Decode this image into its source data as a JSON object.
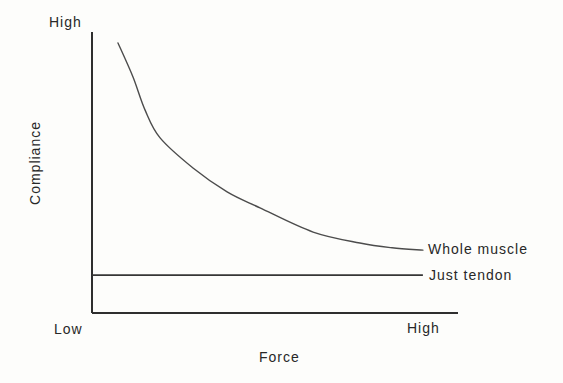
{
  "figure": {
    "background_color": "#fdfdfb",
    "axis_color": "#2e2e2e",
    "curve_color": "#4c4c4c",
    "text_color": "#282828"
  },
  "chart_data": {
    "type": "line",
    "title": "",
    "xlabel": "Force",
    "ylabel": "Compliance",
    "x_tick_labels": [
      "Low",
      "High"
    ],
    "y_tick_labels": [
      "High"
    ],
    "x_range": [
      0,
      1
    ],
    "y_range": [
      0,
      1
    ],
    "grid": false,
    "legend_position": "labels-at-right-end-of-lines",
    "series": [
      {
        "name": "Whole muscle",
        "shape": "exponential-decay",
        "points": [
          [
            0.071,
            0.961
          ],
          [
            0.112,
            0.84
          ],
          [
            0.145,
            0.722
          ],
          [
            0.186,
            0.623
          ],
          [
            0.276,
            0.516
          ],
          [
            0.369,
            0.431
          ],
          [
            0.459,
            0.374
          ],
          [
            0.604,
            0.288
          ],
          [
            0.732,
            0.249
          ],
          [
            0.82,
            0.232
          ],
          [
            0.904,
            0.224
          ]
        ]
      },
      {
        "name": "Just tendon",
        "shape": "horizontal-line",
        "points": [
          [
            0.0,
            0.135
          ],
          [
            0.904,
            0.135
          ]
        ]
      }
    ]
  }
}
